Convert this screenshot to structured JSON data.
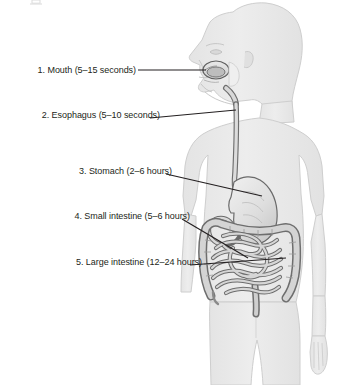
{
  "figure": {
    "type": "anatomical-diagram",
    "background_color": "#ffffff",
    "body_fill_color": "#e8e8e8",
    "body_outline_color": "#cfcfcf",
    "organ_fill_color": "#dcdcdc",
    "organ_outline_color": "#6e6e6e",
    "leader_line_color": "#231f20",
    "text_color": "#231f20"
  },
  "labels": [
    {
      "index": "1",
      "text": "1. Mouth (5–15 seconds)",
      "organ": "mouth",
      "duration": "5–15 seconds"
    },
    {
      "index": "2",
      "text": "2. Esophagus (5–10 seconds)",
      "organ": "esophagus",
      "duration": "5–10 seconds"
    },
    {
      "index": "3",
      "text": "3. Stomach (2–6 hours)",
      "organ": "stomach",
      "duration": "2–6 hours"
    },
    {
      "index": "4",
      "text": "4. Small intestine (5–6 hours)",
      "organ": "small-intestine",
      "duration": "5–6 hours"
    },
    {
      "index": "5",
      "text": "5. Large intestine (12–24 hours)",
      "organ": "large-intestine",
      "duration": "12–24 hours"
    }
  ]
}
